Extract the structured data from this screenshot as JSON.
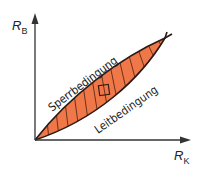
{
  "diagram": {
    "type": "region-diagram",
    "axes": {
      "y_label": {
        "main": "R",
        "sub": "B"
      },
      "x_label": {
        "main": "R",
        "sub": "K"
      }
    },
    "regions": [
      {
        "name": "shaded-lens",
        "fill": "#f07848",
        "hatch": "vertical lines",
        "stroke": "#3a1a10"
      }
    ],
    "curves": [
      {
        "label": "Sperrbedingung",
        "position": "upper boundary"
      },
      {
        "label": "Leitbedingung",
        "position": "lower boundary"
      }
    ],
    "marker": {
      "shape": "square",
      "note": "operating point inside shaded region"
    },
    "colors": {
      "fill": "#f07848",
      "stroke": "#2a1a14",
      "axis": "#333333",
      "background": "#ffffff"
    }
  }
}
